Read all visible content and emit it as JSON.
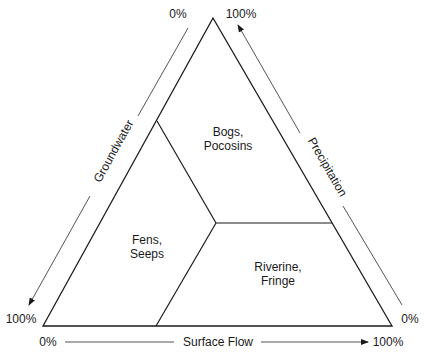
{
  "diagram": {
    "type": "ternary",
    "axes": {
      "groundwater": {
        "label": "Groundwater",
        "start": "0%",
        "end": "100%"
      },
      "precipitation": {
        "label": "Precipitation",
        "start": "0%",
        "end": "100%"
      },
      "surface_flow": {
        "label": "Surface Flow",
        "start": "0%",
        "end": "100%"
      }
    },
    "regions": [
      {
        "line1": "Bogs,",
        "line2": "Pocosins"
      },
      {
        "line1": "Fens,",
        "line2": "Seeps"
      },
      {
        "line1": "Riverine,",
        "line2": "Fringe"
      }
    ],
    "colors": {
      "stroke": "#1a1a1a",
      "axis": "#555555"
    }
  }
}
